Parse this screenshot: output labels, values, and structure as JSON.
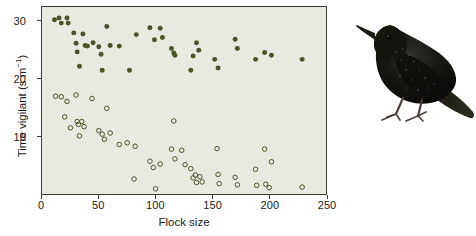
{
  "figure": {
    "bird_image_name": "common-starling-illustration",
    "bird_caption": "Common starling"
  },
  "colors": {
    "plot_background": "#e8e9e0",
    "marker": "#4a5424",
    "axis": "#3b3b33",
    "text": "#1a1a1a",
    "bird_body": "#111110",
    "bird_leg": "#6b5a50"
  },
  "chart_data": {
    "type": "scatter",
    "title": "",
    "xlabel": "Flock size",
    "ylabel_text": "Time vigilant (s m",
    "ylabel_sup": "−1",
    "ylabel_tail": ")",
    "ylabel_full": "Time vigilant (s m⁻¹)",
    "xlim": [
      0,
      250
    ],
    "ylim": [
      0,
      32.5
    ],
    "xticks": [
      0,
      50,
      100,
      150,
      200,
      250
    ],
    "yticks": [
      10,
      20,
      30
    ],
    "xtick_labels": [
      "0",
      "50",
      "100",
      "150",
      "200",
      "250"
    ],
    "ytick_labels": [
      "10",
      "20",
      "30"
    ],
    "grid": false,
    "legend": "none",
    "series": [
      {
        "name": "filled-markers",
        "marker": "filled-circle",
        "points": [
          [
            11,
            30.3
          ],
          [
            15,
            30.6
          ],
          [
            17,
            29.7
          ],
          [
            22,
            30.6
          ],
          [
            23,
            29.7
          ],
          [
            28,
            28.0
          ],
          [
            30,
            26.2
          ],
          [
            31,
            24.7
          ],
          [
            33,
            22.2
          ],
          [
            36,
            27.8
          ],
          [
            38,
            25.8
          ],
          [
            40,
            25.7
          ],
          [
            45,
            26.3
          ],
          [
            50,
            25.6
          ],
          [
            52,
            24.3
          ],
          [
            53,
            21.5
          ],
          [
            57,
            29.1
          ],
          [
            60,
            25.8
          ],
          [
            68,
            25.7
          ],
          [
            77,
            21.5
          ],
          [
            83,
            27.7
          ],
          [
            95,
            28.9
          ],
          [
            99,
            26.8
          ],
          [
            104,
            28.8
          ],
          [
            106,
            27.2
          ],
          [
            114,
            25.3
          ],
          [
            116,
            24.5
          ],
          [
            117,
            24.1
          ],
          [
            131,
            21.5
          ],
          [
            133,
            24.0
          ],
          [
            136,
            26.3
          ],
          [
            138,
            25.0
          ],
          [
            152,
            23.4
          ],
          [
            155,
            21.9
          ],
          [
            170,
            26.9
          ],
          [
            172,
            25.3
          ],
          [
            188,
            23.4
          ],
          [
            196,
            24.6
          ],
          [
            202,
            24.1
          ],
          [
            229,
            23.4
          ]
        ]
      },
      {
        "name": "open-markers",
        "marker": "open-circle",
        "points": [
          [
            12,
            17.0
          ],
          [
            17,
            16.9
          ],
          [
            22,
            16.1
          ],
          [
            20,
            13.4
          ],
          [
            25,
            11.5
          ],
          [
            30,
            17.2
          ],
          [
            31,
            12.6
          ],
          [
            32,
            12.1
          ],
          [
            33,
            10.1
          ],
          [
            35,
            12.6
          ],
          [
            37,
            11.7
          ],
          [
            44,
            16.6
          ],
          [
            50,
            11.0
          ],
          [
            53,
            10.4
          ],
          [
            55,
            9.5
          ],
          [
            57,
            14.9
          ],
          [
            60,
            10.6
          ],
          [
            68,
            8.6
          ],
          [
            75,
            8.9
          ],
          [
            82,
            8.3
          ],
          [
            81,
            2.6
          ],
          [
            95,
            5.7
          ],
          [
            98,
            4.6
          ],
          [
            100,
            0.9
          ],
          [
            104,
            5.2
          ],
          [
            114,
            7.8
          ],
          [
            116,
            12.7
          ],
          [
            117,
            6.1
          ],
          [
            123,
            7.6
          ],
          [
            126,
            5.1
          ],
          [
            131,
            4.4
          ],
          [
            133,
            2.8
          ],
          [
            135,
            3.3
          ],
          [
            136,
            2.0
          ],
          [
            139,
            3.0
          ],
          [
            141,
            2.1
          ],
          [
            154,
            7.9
          ],
          [
            155,
            3.4
          ],
          [
            156,
            1.8
          ],
          [
            170,
            2.9
          ],
          [
            172,
            1.6
          ],
          [
            188,
            4.3
          ],
          [
            189,
            1.5
          ],
          [
            197,
            1.7
          ],
          [
            196,
            7.8
          ],
          [
            200,
            1.1
          ],
          [
            202,
            5.6
          ],
          [
            229,
            1.2
          ]
        ]
      }
    ]
  }
}
